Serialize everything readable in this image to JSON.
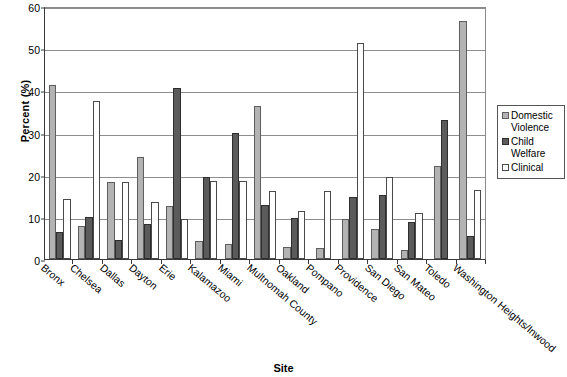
{
  "chart_data": {
    "type": "bar",
    "title": "",
    "xlabel": "Site",
    "ylabel": "Percent (%)",
    "ylim": [
      0,
      60
    ],
    "ytick_step": 10,
    "yticks": [
      0,
      10,
      20,
      30,
      40,
      50,
      60
    ],
    "ytick_labels": [
      "0",
      "10",
      "20",
      "30",
      "40",
      "50",
      "60"
    ],
    "grid": "horizontal",
    "legend_position": "right",
    "categories": [
      "Bronx",
      "Chelsea",
      "Dallas",
      "Dayton",
      "Erie",
      "Kalamazoo",
      "Miami",
      "Multnomah County",
      "Oakland",
      "Pompano",
      "Providence",
      "San Diego",
      "San Mateo",
      "Toledo",
      "Washington Heights/Inwood"
    ],
    "series": [
      {
        "name": "Domestic Violence",
        "color": "#b3b3b3",
        "values": [
          41.2,
          7.8,
          18.2,
          24.3,
          12.5,
          4.2,
          3.5,
          36.3,
          2.9,
          2.5,
          9.5,
          7.2,
          2.2,
          22.0,
          56.5
        ]
      },
      {
        "name": "Child Welfare",
        "color": "#5b5b5b",
        "values": [
          6.5,
          10.0,
          4.5,
          8.2,
          40.5,
          19.5,
          29.8,
          12.8,
          9.8,
          0,
          14.8,
          15.3,
          8.8,
          33.0,
          5.4
        ]
      },
      {
        "name": "Clinical",
        "color": "#ffffff",
        "values": [
          14.3,
          37.4,
          18.2,
          13.5,
          9.4,
          18.6,
          18.6,
          16.2,
          11.5,
          16.2,
          51.2,
          19.5,
          10.8,
          0,
          16.3
        ]
      }
    ]
  },
  "legend": {
    "entries": [
      {
        "label": "Domestic\nViolence",
        "icon": "swatch-domestic-violence"
      },
      {
        "label": "Child\nWelfare",
        "icon": "swatch-child-welfare"
      },
      {
        "label": "Clinical",
        "icon": "swatch-clinical"
      }
    ]
  }
}
